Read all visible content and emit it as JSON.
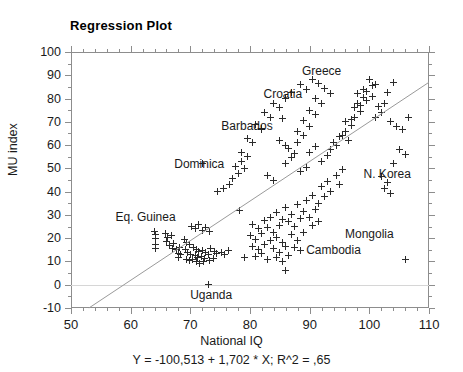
{
  "chart_data": {
    "type": "scatter",
    "title": "Regression Plot",
    "xlabel": "National IQ",
    "ylabel": "MU index",
    "xlim": [
      50,
      110
    ],
    "ylim": [
      -10,
      100
    ],
    "xticks": [
      50,
      60,
      70,
      80,
      90,
      100,
      110
    ],
    "yticks": [
      -10,
      0,
      10,
      20,
      30,
      40,
      50,
      60,
      70,
      80,
      90,
      100
    ],
    "x_minor_step": 2,
    "grid": false,
    "zero_gridline": true,
    "legend": null,
    "equation_text": "Y = -100,513 + 1,702 * X; R^2 = ,65",
    "regression": {
      "slope": 1.702,
      "intercept": -100.513,
      "r_squared": 0.65,
      "line_start": [
        53.0,
        -10
      ],
      "line_end": [
        110.0,
        87.0
      ]
    },
    "annotations": [
      {
        "label": "Greece",
        "lx": 92.0,
        "ly": 92.0
      },
      {
        "label": "Croatia",
        "lx": 85.5,
        "ly": 82.0
      },
      {
        "label": "Barbados",
        "lx": 79.5,
        "ly": 68.0
      },
      {
        "label": "Dominica",
        "lx": 71.5,
        "ly": 52.0
      },
      {
        "label": "Eq. Guinea",
        "lx": 62.5,
        "ly": 29.0
      },
      {
        "label": "N. Korea",
        "lx": 103.0,
        "ly": 47.5
      },
      {
        "label": "Mongolia",
        "lx": 100.0,
        "ly": 22.0
      },
      {
        "label": "Cambodia",
        "lx": 94.0,
        "ly": 15.0
      },
      {
        "label": "Uganda",
        "lx": 73.5,
        "ly": -4.5
      }
    ],
    "points": [
      [
        64.0,
        23.0
      ],
      [
        73.0,
        0.0
      ],
      [
        64.2,
        21.5
      ],
      [
        64.2,
        19.8
      ],
      [
        64.2,
        17.2
      ],
      [
        64.2,
        15.4
      ],
      [
        65.8,
        22.0
      ],
      [
        66.2,
        20.5
      ],
      [
        66.8,
        21.0
      ],
      [
        66.0,
        18.5
      ],
      [
        66.5,
        17.0
      ],
      [
        67.2,
        17.8
      ],
      [
        67.0,
        15.6
      ],
      [
        67.6,
        15.0
      ],
      [
        68.2,
        16.2
      ],
      [
        68.0,
        13.6
      ],
      [
        68.4,
        12.8
      ],
      [
        68.0,
        11.5
      ],
      [
        69.0,
        19.5
      ],
      [
        69.4,
        18.0
      ],
      [
        69.8,
        17.2
      ],
      [
        69.2,
        15.0
      ],
      [
        69.6,
        14.0
      ],
      [
        70.0,
        13.0
      ],
      [
        69.4,
        11.0
      ],
      [
        69.9,
        10.2
      ],
      [
        70.4,
        10.8
      ],
      [
        70.6,
        16.0
      ],
      [
        71.0,
        15.2
      ],
      [
        71.4,
        14.4
      ],
      [
        70.8,
        12.6
      ],
      [
        71.2,
        11.8
      ],
      [
        71.8,
        12.2
      ],
      [
        71.0,
        9.8
      ],
      [
        71.6,
        9.2
      ],
      [
        72.2,
        10.0
      ],
      [
        72.0,
        14.8
      ],
      [
        72.6,
        13.8
      ],
      [
        73.0,
        13.2
      ],
      [
        72.4,
        11.2
      ],
      [
        73.2,
        10.6
      ],
      [
        73.8,
        11.4
      ],
      [
        73.4,
        15.6
      ],
      [
        74.0,
        14.2
      ],
      [
        74.4,
        13.4
      ],
      [
        70.2,
        25.0
      ],
      [
        70.8,
        24.2
      ],
      [
        71.4,
        26.0
      ],
      [
        72.0,
        23.4
      ],
      [
        72.6,
        24.6
      ],
      [
        73.2,
        22.8
      ],
      [
        75.2,
        14.0
      ],
      [
        75.8,
        13.2
      ],
      [
        76.4,
        14.6
      ],
      [
        78.2,
        32.0
      ],
      [
        79.0,
        11.5
      ],
      [
        106.0,
        11.0
      ],
      [
        86.0,
        6.0
      ],
      [
        77.0,
        45.5
      ],
      [
        74.5,
        40.0
      ],
      [
        75.5,
        41.5
      ],
      [
        76.5,
        43.0
      ],
      [
        78.0,
        48.0
      ],
      [
        79.0,
        50.0
      ],
      [
        72.0,
        52.0
      ],
      [
        82.0,
        66.5
      ],
      [
        85.5,
        71.5
      ],
      [
        88.0,
        61.0
      ],
      [
        80.5,
        26.0
      ],
      [
        81.5,
        24.0
      ],
      [
        82.5,
        27.5
      ],
      [
        80.0,
        21.0
      ],
      [
        81.0,
        19.5
      ],
      [
        82.0,
        22.0
      ],
      [
        80.5,
        16.5
      ],
      [
        81.5,
        15.0
      ],
      [
        82.5,
        17.5
      ],
      [
        81.0,
        12.0
      ],
      [
        82.0,
        13.5
      ],
      [
        83.0,
        11.0
      ],
      [
        83.5,
        29.0
      ],
      [
        84.5,
        31.0
      ],
      [
        85.5,
        28.0
      ],
      [
        83.0,
        24.5
      ],
      [
        84.0,
        22.5
      ],
      [
        85.0,
        25.5
      ],
      [
        83.5,
        19.0
      ],
      [
        84.5,
        20.5
      ],
      [
        85.5,
        18.0
      ],
      [
        84.0,
        15.5
      ],
      [
        85.0,
        14.0
      ],
      [
        86.0,
        16.5
      ],
      [
        84.5,
        11.5
      ],
      [
        85.5,
        10.0
      ],
      [
        86.5,
        12.5
      ],
      [
        86.0,
        33.0
      ],
      [
        87.0,
        30.0
      ],
      [
        88.0,
        34.5
      ],
      [
        86.5,
        27.0
      ],
      [
        87.5,
        25.0
      ],
      [
        88.5,
        28.5
      ],
      [
        87.0,
        21.5
      ],
      [
        88.0,
        19.0
      ],
      [
        89.0,
        22.5
      ],
      [
        87.5,
        16.0
      ],
      [
        88.5,
        14.5
      ],
      [
        89.5,
        36.0
      ],
      [
        90.5,
        38.5
      ],
      [
        91.5,
        35.0
      ],
      [
        89.0,
        31.5
      ],
      [
        90.0,
        29.0
      ],
      [
        91.0,
        32.5
      ],
      [
        90.5,
        25.5
      ],
      [
        91.5,
        27.0
      ],
      [
        92.0,
        42.0
      ],
      [
        93.0,
        44.5
      ],
      [
        92.5,
        38.0
      ],
      [
        93.5,
        40.0
      ],
      [
        94.5,
        47.0
      ],
      [
        95.5,
        49.5
      ],
      [
        95.0,
        43.0
      ],
      [
        83.0,
        47.0
      ],
      [
        84.0,
        45.0
      ],
      [
        86.0,
        52.0
      ],
      [
        87.0,
        54.5
      ],
      [
        88.5,
        48.5
      ],
      [
        89.5,
        50.5
      ],
      [
        90.0,
        57.0
      ],
      [
        91.0,
        59.5
      ],
      [
        92.0,
        53.0
      ],
      [
        93.0,
        55.5
      ],
      [
        94.0,
        61.0
      ],
      [
        95.0,
        63.5
      ],
      [
        93.5,
        58.0
      ],
      [
        94.5,
        60.0
      ],
      [
        96.0,
        66.0
      ],
      [
        97.0,
        68.5
      ],
      [
        95.5,
        64.0
      ],
      [
        96.5,
        62.0
      ],
      [
        97.5,
        72.0
      ],
      [
        98.5,
        74.5
      ],
      [
        96.0,
        70.0
      ],
      [
        97.0,
        71.0
      ],
      [
        98.0,
        78.0
      ],
      [
        99.0,
        80.5
      ],
      [
        97.5,
        76.0
      ],
      [
        98.5,
        77.0
      ],
      [
        99.5,
        83.0
      ],
      [
        100.5,
        85.5
      ],
      [
        98.0,
        82.0
      ],
      [
        99.0,
        84.0
      ],
      [
        100.0,
        88.0
      ],
      [
        101.0,
        86.0
      ],
      [
        99.5,
        79.0
      ],
      [
        100.5,
        81.0
      ],
      [
        101.5,
        76.5
      ],
      [
        102.5,
        78.0
      ],
      [
        101.0,
        72.0
      ],
      [
        102.0,
        74.0
      ],
      [
        103.0,
        82.5
      ],
      [
        104.0,
        87.0
      ],
      [
        103.5,
        70.0
      ],
      [
        104.5,
        68.0
      ],
      [
        105.5,
        66.5
      ],
      [
        106.5,
        72.0
      ],
      [
        105.0,
        58.0
      ],
      [
        106.0,
        56.0
      ],
      [
        104.0,
        52.0
      ],
      [
        102.0,
        46.5
      ],
      [
        103.0,
        44.0
      ],
      [
        102.5,
        41.5
      ],
      [
        103.5,
        39.0
      ],
      [
        88.5,
        86.0
      ],
      [
        89.5,
        84.0
      ],
      [
        87.0,
        82.5
      ],
      [
        86.0,
        80.0
      ],
      [
        84.0,
        78.0
      ],
      [
        85.0,
        76.0
      ],
      [
        82.5,
        74.0
      ],
      [
        83.5,
        72.0
      ],
      [
        81.0,
        69.0
      ],
      [
        82.0,
        67.0
      ],
      [
        79.5,
        63.0
      ],
      [
        80.5,
        61.0
      ],
      [
        78.5,
        57.0
      ],
      [
        79.5,
        55.0
      ],
      [
        77.5,
        51.0
      ],
      [
        78.5,
        53.0
      ],
      [
        90.5,
        88.0
      ],
      [
        91.5,
        86.5
      ],
      [
        92.5,
        84.5
      ],
      [
        93.5,
        82.0
      ],
      [
        91.0,
        80.0
      ],
      [
        92.0,
        78.0
      ],
      [
        90.0,
        75.0
      ],
      [
        91.0,
        73.0
      ],
      [
        89.0,
        70.5
      ],
      [
        90.0,
        68.0
      ],
      [
        88.0,
        66.0
      ],
      [
        89.0,
        64.0
      ],
      [
        86.5,
        58.5
      ],
      [
        87.5,
        56.5
      ],
      [
        85.0,
        62.0
      ],
      [
        86.0,
        60.0
      ]
    ]
  }
}
